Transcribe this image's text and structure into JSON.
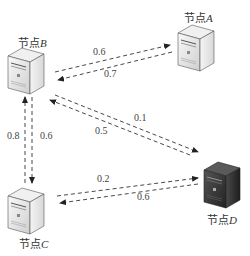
{
  "nodes": {
    "A": {
      "prefix": "节点",
      "letter": "A",
      "style": "light"
    },
    "B": {
      "prefix": "节点",
      "letter": "B",
      "style": "light"
    },
    "C": {
      "prefix": "节点",
      "letter": "C",
      "style": "light"
    },
    "D": {
      "prefix": "节点",
      "letter": "D",
      "style": "dark"
    }
  },
  "edges": [
    {
      "from": "B",
      "to": "A",
      "weight": "0.6"
    },
    {
      "from": "A",
      "to": "B",
      "weight": "0.7"
    },
    {
      "from": "B",
      "to": "D",
      "weight": "0.1"
    },
    {
      "from": "D",
      "to": "B",
      "weight": "0.5"
    },
    {
      "from": "C",
      "to": "B",
      "weight": "0.8"
    },
    {
      "from": "B",
      "to": "C",
      "weight": "0.6"
    },
    {
      "from": "C",
      "to": "D",
      "weight": "0.2"
    },
    {
      "from": "D",
      "to": "C",
      "weight": "0.6"
    }
  ],
  "colors": {
    "line": "#333333",
    "light_server": "#e8e8e8",
    "dark_server": "#3a3a3a"
  }
}
